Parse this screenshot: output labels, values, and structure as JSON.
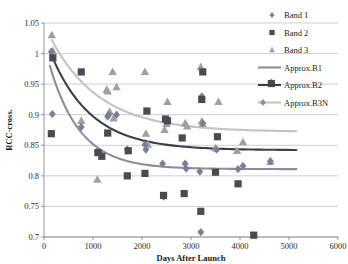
{
  "chart_data": {
    "type": "scatter",
    "title": "",
    "xlabel": "Days After Launch",
    "ylabel": "RCC-cross.",
    "xlim": [
      0,
      6000
    ],
    "ylim": [
      0.7,
      1.05
    ],
    "xticks": [
      0,
      1000,
      2000,
      3000,
      4000,
      5000,
      6000
    ],
    "yticks": [
      0.7,
      0.75,
      0.8,
      0.85,
      0.9,
      0.95,
      1,
      1.05
    ],
    "xtick_labels": [
      "0",
      "1000",
      "2000",
      "3000",
      "4000",
      "5000",
      "6000"
    ],
    "ytick_labels": [
      "0.7",
      "0.75",
      "0.8",
      "0.85",
      "0.9",
      "0.95",
      "1",
      "1.05"
    ],
    "grid": "horizontal",
    "legend_position": "top-right",
    "colors": {
      "band1": "#7b7f96",
      "band2": "#4a4a52",
      "band3": "#a0a0a0",
      "approx_b1": "#8a8d9e",
      "approx_b2": "#3f3f47",
      "approx_b3n": "#c3c3c3"
    },
    "series": [
      {
        "name": "Band 1",
        "marker": "diamond",
        "color": "#7b7f96",
        "points": [
          [
            150,
            1.003
          ],
          [
            170,
            0.901
          ],
          [
            760,
            0.88
          ],
          [
            1090,
            0.84
          ],
          [
            1130,
            0.838
          ],
          [
            1300,
            0.897
          ],
          [
            1320,
            0.9
          ],
          [
            1480,
            0.9
          ],
          [
            1700,
            0.843
          ],
          [
            2060,
            0.851
          ],
          [
            2080,
            0.843
          ],
          [
            2420,
            0.82
          ],
          [
            2440,
            0.766
          ],
          [
            2880,
            0.82
          ],
          [
            2900,
            0.812
          ],
          [
            3180,
            0.807
          ],
          [
            3200,
            0.708
          ],
          [
            3220,
            0.93
          ],
          [
            3240,
            0.886
          ],
          [
            3520,
            0.843
          ],
          [
            3960,
            0.811
          ],
          [
            4060,
            0.816
          ],
          [
            4620,
            0.824
          ],
          [
            4640,
            0.952
          ]
        ]
      },
      {
        "name": "Band 2",
        "marker": "square",
        "color": "#4a4a52",
        "points": [
          [
            150,
            0.869
          ],
          [
            180,
            0.993
          ],
          [
            760,
            0.97
          ],
          [
            1100,
            0.838
          ],
          [
            1180,
            0.832
          ],
          [
            1300,
            0.87
          ],
          [
            1700,
            0.8
          ],
          [
            1720,
            0.841
          ],
          [
            2060,
            0.804
          ],
          [
            2100,
            0.906
          ],
          [
            2440,
            0.768
          ],
          [
            2480,
            0.893
          ],
          [
            2520,
            0.89
          ],
          [
            2820,
            0.862
          ],
          [
            2860,
            0.771
          ],
          [
            3200,
            0.742
          ],
          [
            3220,
            0.925
          ],
          [
            3240,
            0.97
          ],
          [
            3500,
            0.806
          ],
          [
            3540,
            0.864
          ],
          [
            3960,
            0.787
          ],
          [
            4280,
            0.703
          ],
          [
            4640,
            0.951
          ]
        ]
      },
      {
        "name": "Band 3",
        "marker": "triangle",
        "color": "#a0a0a0",
        "points": [
          [
            160,
            1.03
          ],
          [
            180,
            1.004
          ],
          [
            760,
            0.89
          ],
          [
            1090,
            0.794
          ],
          [
            1280,
            0.941
          ],
          [
            1300,
            0.938
          ],
          [
            1340,
            0.905
          ],
          [
            1400,
            0.97
          ],
          [
            1420,
            0.894
          ],
          [
            1480,
            0.945
          ],
          [
            2060,
            0.97
          ],
          [
            2080,
            0.869
          ],
          [
            2120,
            0.851
          ],
          [
            2460,
            0.875
          ],
          [
            2500,
            0.885
          ],
          [
            2520,
            0.921
          ],
          [
            2880,
            0.886
          ],
          [
            2920,
            0.881
          ],
          [
            3200,
            0.978
          ],
          [
            3220,
            0.889
          ],
          [
            3240,
            0.885
          ],
          [
            3500,
            0.845
          ],
          [
            3560,
            0.921
          ],
          [
            3940,
            0.841
          ],
          [
            4060,
            0.855
          ],
          [
            4620,
            0.823
          ],
          [
            4640,
            0.952
          ]
        ]
      }
    ],
    "curves": [
      {
        "name": "Approx.B1",
        "color": "#8a8d9e",
        "asymptote": 0.811,
        "start_value": 0.98,
        "decay_days": 620,
        "x_start": 120,
        "x_end": 5150
      },
      {
        "name": "Approx.B2",
        "color": "#3f3f47",
        "asymptote": 0.842,
        "start_value": 1.0,
        "decay_days": 820,
        "x_start": 140,
        "x_end": 5150
      },
      {
        "name": "Approx.B3N",
        "color": "#c3c3c3",
        "asymptote": 0.872,
        "start_value": 1.022,
        "decay_days": 1000,
        "x_start": 160,
        "x_end": 5150
      }
    ],
    "legend": [
      {
        "label": "Band 1",
        "kind": "marker",
        "marker": "diamond",
        "color": "#7b7f96"
      },
      {
        "label": "Band 2",
        "kind": "marker",
        "marker": "square",
        "color": "#4a4a52"
      },
      {
        "label": "Band 3",
        "kind": "marker",
        "marker": "triangle",
        "color": "#a0a0a0"
      },
      {
        "label": "Approx.B1",
        "kind": "line",
        "color": "#8a8d9e"
      },
      {
        "label": "Approx.B2",
        "kind": "line",
        "color": "#3f3f47"
      },
      {
        "label": "Approx.B3N",
        "kind": "line-marker",
        "marker": "diamond",
        "color": "#c3c3c3"
      }
    ]
  }
}
